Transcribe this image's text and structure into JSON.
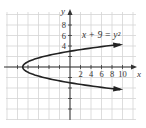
{
  "chart_data": {
    "type": "line",
    "title": "",
    "equation_label": "x + 9 = y²",
    "xlabel": "x",
    "ylabel": "y",
    "x_tick_labels": [
      "2",
      "4",
      "6",
      "8",
      "10"
    ],
    "y_tick_labels": [
      "4",
      "6",
      "8"
    ],
    "xlim": [
      -12,
      12
    ],
    "ylim": [
      -10,
      10
    ],
    "grid": true,
    "grid_step": 2,
    "series": [
      {
        "name": "x + 9 = y²",
        "function": "x = y^2 - 9",
        "x": [
          10,
          7,
          0,
          -5,
          -8,
          -9,
          -8,
          -5,
          0,
          7,
          10
        ],
        "y": [
          4.36,
          4,
          3,
          2,
          1,
          0,
          -1,
          -2,
          -3,
          -4,
          -4.36
        ]
      }
    ],
    "vertex": [
      -9,
      0
    ],
    "colors": {
      "curve": "#222222",
      "grid": "#d4d4d4",
      "axis": "#333333"
    }
  }
}
